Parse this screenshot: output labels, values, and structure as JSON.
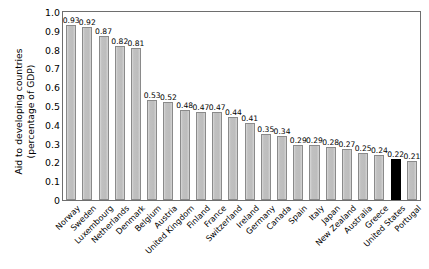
{
  "chart_data": {
    "type": "bar",
    "title": "",
    "xlabel": "",
    "ylabel": "Aid to developing countries\n(percentage of GDP)",
    "ylim": [
      0,
      1.0
    ],
    "ytick_labels": [
      "1.0",
      "0.9",
      "0.8",
      "0.7",
      "0.6",
      "0.5",
      "0.4",
      "0.3",
      "0.2",
      "0.1",
      "0"
    ],
    "ytick_values": [
      1.0,
      0.9,
      0.8,
      0.7,
      0.6,
      0.5,
      0.4,
      0.3,
      0.2,
      0.1,
      0
    ],
    "grid": false,
    "legend": "none",
    "highlight_color": "#000000",
    "bar_color": "#c4c4c4",
    "bar_edge_color": "#8a8a8a",
    "categories": [
      "Norway",
      "Sweden",
      "Luxembourg",
      "Netherlands",
      "Denmark",
      "Belgium",
      "Austria",
      "United Kingdom",
      "Finland",
      "France",
      "Switzerland",
      "Ireland",
      "Germany",
      "Canada",
      "Spain",
      "Italy",
      "Japan",
      "New Zealand",
      "Australia",
      "Greece",
      "United States",
      "Portugal"
    ],
    "values": [
      0.93,
      0.92,
      0.87,
      0.82,
      0.81,
      0.53,
      0.52,
      0.48,
      0.47,
      0.47,
      0.44,
      0.41,
      0.35,
      0.34,
      0.29,
      0.29,
      0.28,
      0.27,
      0.25,
      0.24,
      0.22,
      0.21
    ],
    "value_labels": [
      "0.93",
      "0.92",
      "0.87",
      "0.82",
      "0.81",
      "0.53",
      "0.52",
      "0.48",
      "0.47",
      "0.47",
      "0.44",
      "0.41",
      "0.35",
      "0.34",
      "0.29",
      "0.29",
      "0.28",
      "0.27",
      "0.25",
      "0.24",
      "0.22",
      "0.21"
    ],
    "highlighted": [
      "United States"
    ]
  }
}
